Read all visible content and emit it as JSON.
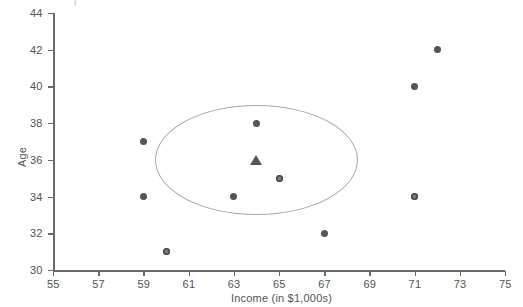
{
  "chart_data": {
    "type": "scatter",
    "title": "",
    "xlabel": "Income (in $1,000s)",
    "ylabel": "Age",
    "xlim": [
      55,
      75
    ],
    "ylim": [
      30,
      44
    ],
    "xticks": [
      55,
      57,
      59,
      61,
      63,
      65,
      67,
      69,
      71,
      73,
      75
    ],
    "yticks": [
      30,
      32,
      34,
      36,
      38,
      40,
      42,
      44
    ],
    "grid": false,
    "legend": null,
    "series": [
      {
        "name": "observations",
        "marker": "circle",
        "color": "#555555",
        "points": [
          {
            "x": 59,
            "y": 37,
            "marker": "dot"
          },
          {
            "x": 59,
            "y": 34,
            "marker": "dot"
          },
          {
            "x": 60,
            "y": 31,
            "marker": "ring"
          },
          {
            "x": 63,
            "y": 34,
            "marker": "dot"
          },
          {
            "x": 64,
            "y": 38,
            "marker": "dot"
          },
          {
            "x": 65,
            "y": 35,
            "marker": "ring"
          },
          {
            "x": 67,
            "y": 32,
            "marker": "dot"
          },
          {
            "x": 71,
            "y": 40,
            "marker": "dot"
          },
          {
            "x": 71,
            "y": 34,
            "marker": "ring"
          },
          {
            "x": 72,
            "y": 42,
            "marker": "dot"
          }
        ]
      },
      {
        "name": "cluster-centroid",
        "marker": "triangle",
        "color": "#565656",
        "points": [
          {
            "x": 64,
            "y": 36,
            "marker": "triangle"
          }
        ]
      }
    ],
    "annotations": [
      {
        "type": "circle",
        "name": "cluster-boundary",
        "cx": 64,
        "cy": 36,
        "rx": 4.5,
        "ry": 3.0,
        "color": "#a8a8a8"
      }
    ]
  },
  "axes": {
    "x_label": "Income (in $1,000s)",
    "y_label": "Age",
    "x_tick_labels": [
      "55",
      "57",
      "59",
      "61",
      "63",
      "65",
      "67",
      "69",
      "71",
      "73",
      "75"
    ],
    "y_tick_labels": [
      "30",
      "32",
      "34",
      "36",
      "38",
      "40",
      "42",
      "44"
    ]
  },
  "colors": {
    "axis": "#6b6b6b",
    "tick_text": "#545454",
    "marker": "#555555",
    "centroid": "#565656",
    "cluster_outline": "#a8a8a8",
    "background": "#ffffff"
  }
}
